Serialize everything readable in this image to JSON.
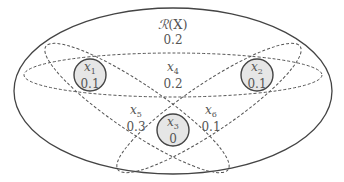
{
  "diagram": {
    "universe": {
      "label_script": "ℛ",
      "label_paren": "(X)",
      "value": "0.2"
    },
    "regions": [
      {
        "id": "x1",
        "var": "x",
        "sub": "1",
        "value": "0.1",
        "circled": true
      },
      {
        "id": "x2",
        "var": "x",
        "sub": "2",
        "value": "0.1",
        "circled": true
      },
      {
        "id": "x3",
        "var": "x",
        "sub": "3",
        "value": "0",
        "circled": true
      },
      {
        "id": "x4",
        "var": "x",
        "sub": "4",
        "value": "0.2",
        "circled": false
      },
      {
        "id": "x5",
        "var": "x",
        "sub": "5",
        "value": "0.3",
        "circled": false
      },
      {
        "id": "x6",
        "var": "x",
        "sub": "6",
        "value": "0.1",
        "circled": false
      }
    ],
    "colors": {
      "stroke": "#444444",
      "circle_fill": "#e6e6e6",
      "text": "#555555"
    }
  }
}
